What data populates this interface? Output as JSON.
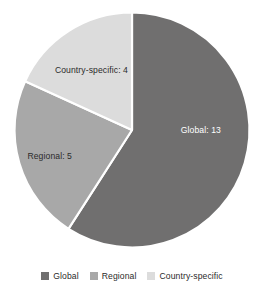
{
  "chart_data": {
    "type": "pie",
    "title": "",
    "xlabel": "",
    "ylabel": "",
    "total": 22,
    "categories": [
      "Global",
      "Regional",
      "Country-specific"
    ],
    "values": [
      13,
      5,
      4
    ],
    "data_labels": [
      "Global: 13",
      "Regional: 5",
      "Country-specific: 4"
    ],
    "colors": [
      "#706f6f",
      "#a8a8a8",
      "#dcdcdc"
    ],
    "start_angle_deg": 0,
    "direction": "clockwise",
    "slice_gap": true,
    "grid": false,
    "legend_position": "bottom",
    "legend": [
      {
        "label": "Global",
        "color": "#706f6f"
      },
      {
        "label": "Regional",
        "color": "#a8a8a8"
      },
      {
        "label": "Country-specific",
        "color": "#dcdcdc"
      }
    ]
  },
  "background_color": "#ffffff",
  "label_text_colors": {
    "on_dark": "#ffffff",
    "on_light": "#2b2b2b"
  }
}
